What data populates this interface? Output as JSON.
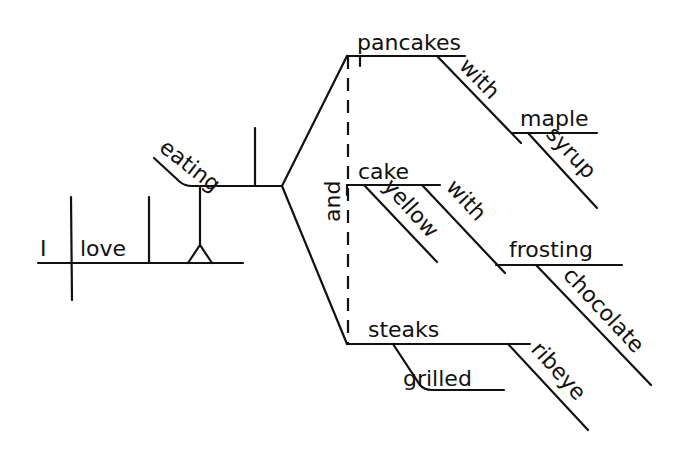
{
  "diagram": {
    "type": "sentence-diagram",
    "subject": {
      "word": "I"
    },
    "verb": {
      "word": "love"
    },
    "gerund_object": {
      "word": "eating"
    },
    "conjunction": {
      "word": "and"
    },
    "compound_objects": [
      {
        "word": "pancakes",
        "modifiers": [
          {
            "word": "with",
            "type": "preposition",
            "object": {
              "word": "syrup",
              "modifiers": [
                {
                  "word": "maple"
                }
              ]
            }
          }
        ]
      },
      {
        "word": "cake",
        "modifiers": [
          {
            "word": "yellow",
            "type": "adjective"
          },
          {
            "word": "with",
            "type": "preposition",
            "object": {
              "word": "frosting",
              "modifiers": [
                {
                  "word": "chocolate"
                }
              ]
            }
          }
        ]
      },
      {
        "word": "steaks",
        "modifiers": [
          {
            "word": "grilled",
            "type": "adjective"
          },
          {
            "word": "ribeye",
            "type": "adjective"
          }
        ]
      }
    ]
  },
  "labels": {
    "I": "I",
    "love": "love",
    "eating": "eating",
    "and": "and",
    "pancakes": "pancakes",
    "with1": "with",
    "maple": "maple",
    "syrup": "syrup",
    "cake": "cake",
    "yellow": "yellow",
    "with2": "with",
    "frosting": "frosting",
    "chocolate": "chocolate",
    "steaks": "steaks",
    "grilled": "grilled",
    "ribeye": "ribeye"
  }
}
